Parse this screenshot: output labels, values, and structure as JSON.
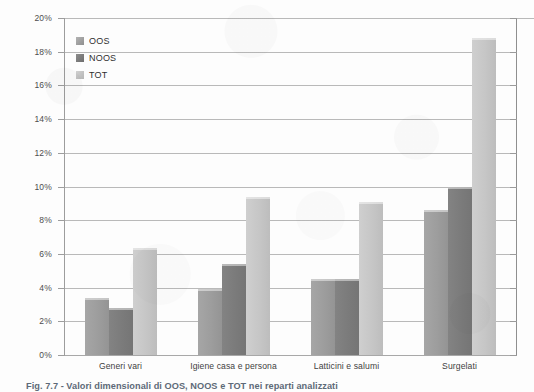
{
  "chart_data": {
    "type": "bar",
    "title": "",
    "xlabel": "",
    "ylabel": "",
    "ylim": [
      0,
      20
    ],
    "y_unit": "%",
    "grid": true,
    "legend_position": "top-left",
    "categories": [
      "Generi vari",
      "Igiene casa e persona",
      "Latticini e salumi",
      "Surgelati"
    ],
    "y_ticks": [
      "0%",
      "2%",
      "4%",
      "6%",
      "8%",
      "10%",
      "12%",
      "14%",
      "16%",
      "18%",
      "20%"
    ],
    "y_tick_values": [
      0,
      2,
      4,
      6,
      8,
      10,
      12,
      14,
      16,
      18,
      20
    ],
    "series": [
      {
        "name": "OOS",
        "color": "#9d9d9d",
        "values": [
          3.4,
          3.9,
          4.5,
          8.6
        ]
      },
      {
        "name": "NOOS",
        "color": "#7b7b7b",
        "values": [
          2.8,
          5.4,
          4.5,
          10.0
        ]
      },
      {
        "name": "TOT",
        "color": "#c6c6c6",
        "values": [
          6.35,
          9.4,
          9.1,
          18.8
        ]
      }
    ]
  },
  "legend": {
    "items": [
      {
        "label": "OOS"
      },
      {
        "label": "NOOS"
      },
      {
        "label": "TOT"
      }
    ]
  },
  "caption": {
    "text": "Fig. 7.7 - Valori dimensionali di OOS, NOOS e TOT nei reparti analizzati"
  }
}
